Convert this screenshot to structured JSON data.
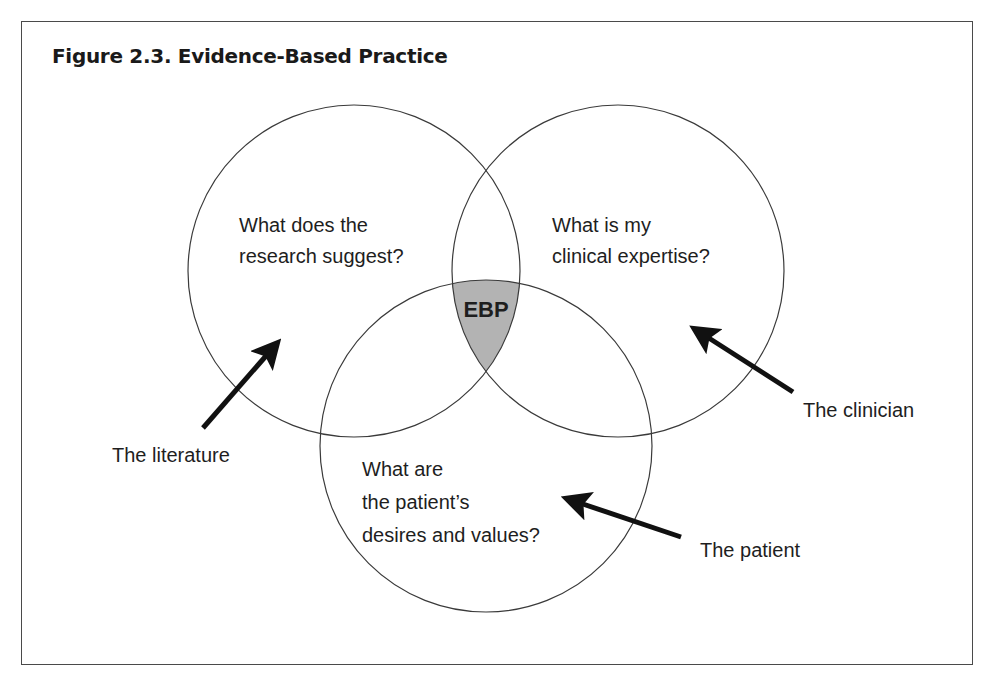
{
  "figure": {
    "title": "Figure 2.3. Evidence-Based Practice"
  },
  "circles": [
    {
      "id": "research",
      "cx": 354,
      "cy": 271,
      "r": 166,
      "question_lines": [
        "What does the",
        "research suggest?"
      ]
    },
    {
      "id": "clinical",
      "cx": 618,
      "cy": 271,
      "r": 166,
      "question_lines": [
        "What is my",
        "clinical expertise?"
      ]
    },
    {
      "id": "patient",
      "cx": 486,
      "cy": 446,
      "r": 166,
      "question_lines": [
        "What are",
        "the patient’s",
        "desires and values?"
      ]
    }
  ],
  "intersection": {
    "label": "EBP",
    "fill_color": "#b3b3b3"
  },
  "arrows": [
    {
      "id": "literature",
      "label": "The literature"
    },
    {
      "id": "clinician",
      "label": "The clinician"
    },
    {
      "id": "patient",
      "label": "The patient"
    }
  ],
  "colors": {
    "stroke": "#3a3a3a",
    "arrow": "#111111",
    "frame": "#4a4a4a"
  }
}
